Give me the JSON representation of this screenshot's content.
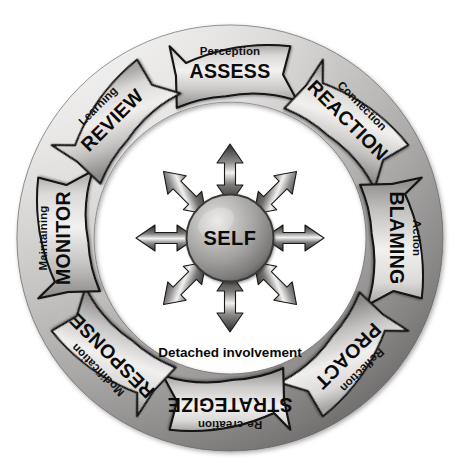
{
  "diagram": {
    "center": {
      "label": "SELF"
    },
    "caption": "Detached involvement",
    "colors": {
      "ring_light": "#eceaea",
      "ring_mid": "#b9b7b6",
      "ring_dark": "#7e7c7b",
      "chevron_light": "#f2f1f0",
      "chevron_mid": "#bdbcbb",
      "chevron_dark": "#838281",
      "outline": "#111111",
      "sphere_light": "#d8d7d6",
      "sphere_mid": "#a3a2a1",
      "sphere_dark": "#5d5c5b",
      "arrow_light": "#f4f3f2",
      "arrow_dark": "#3b3a39",
      "text": "#0a0a0a",
      "background": "#ffffff"
    },
    "segments": [
      {
        "sub": "Perception",
        "main": "ASSESS",
        "angle": 0,
        "position": "top"
      },
      {
        "sub": "Connection",
        "main": "REACTION",
        "angle": 45,
        "position": "top-right"
      },
      {
        "sub": "Action",
        "main": "BLAMING",
        "angle": 90,
        "position": "right"
      },
      {
        "sub": "Reflection",
        "main": "PROACT",
        "angle": 135,
        "position": "bottom-right"
      },
      {
        "sub": "Re-creation",
        "main": "STRATEGIZE",
        "angle": 180,
        "position": "bottom"
      },
      {
        "sub": "Modification",
        "main": "RESPONSE",
        "angle": 225,
        "position": "bottom-left"
      },
      {
        "sub": "Maintaining",
        "main": "MONITOR",
        "angle": 270,
        "position": "left"
      },
      {
        "sub": "Learning",
        "main": "REVIEW",
        "angle": 315,
        "position": "top-left"
      }
    ],
    "radial_arrows": {
      "count": 8,
      "directions": [
        "N",
        "NE",
        "E",
        "SE",
        "S",
        "SW",
        "W",
        "NW"
      ],
      "style": "double-headed"
    },
    "geometry": {
      "cx": 230,
      "cy": 238,
      "disc_radius": 213,
      "inner_white_radius": 136,
      "chevron_outer_radius": 200,
      "chevron_inner_radius": 142,
      "sphere_radius": 43
    }
  }
}
